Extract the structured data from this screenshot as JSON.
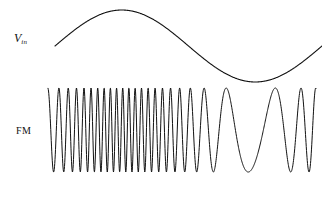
{
  "figure": {
    "background_color": "#ffffff",
    "stroke_color": "#111111",
    "width": 322,
    "height": 198
  },
  "labels": {
    "modulating_signal": {
      "base": "V",
      "subscript": "in",
      "full": "Vin"
    },
    "modulated_signal": "FM"
  },
  "chart_data": {
    "type": "line",
    "xlabel": "",
    "ylabel": "",
    "grid": false,
    "legend": "none",
    "series": [
      {
        "name": "Vin",
        "role": "modulating-signal",
        "waveform": "sine",
        "amplitude": 36,
        "baseline_y": 46,
        "cycles": 1,
        "phase_deg": 0,
        "x_start": 55,
        "x_end": 322,
        "peak": {
          "x": 145,
          "y": 10
        },
        "trough": {
          "x": 268,
          "y": 81
        },
        "stroke_width": 1.1
      },
      {
        "name": "FM",
        "role": "modulated-carrier",
        "waveform": "frequency-modulated-sine",
        "amplitude": 42,
        "baseline_y": 130,
        "top_y": 88,
        "bottom_y": 172,
        "x_start": 48,
        "x_end": 316,
        "carrier_cycles": 24,
        "deviation_ratio": 0.82,
        "max_frequency_at_x": 110,
        "min_frequency_at_x": 268,
        "stroke_width": 1.0
      }
    ]
  }
}
